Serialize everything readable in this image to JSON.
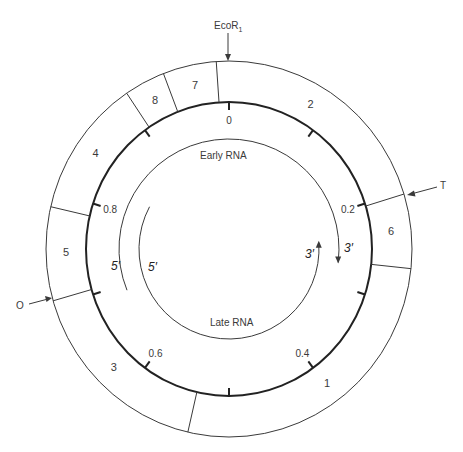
{
  "geometry": {
    "cx": 229,
    "cy": 249,
    "outer_rx": 183,
    "outer_ry": 188,
    "inner_rx": 143,
    "inner_ry": 147,
    "early_r": 110,
    "late_r": 90
  },
  "colors": {
    "line": "#3a3a3a",
    "thick_line": "#222222",
    "text": "#3a3a3a",
    "background": "#ffffff"
  },
  "segment_boundaries_deg": [
    -4,
    -21,
    -34,
    -77,
    -106,
    193,
    96,
    73
  ],
  "segments": [
    {
      "label": "7",
      "angle": -12,
      "r": 165
    },
    {
      "label": "8",
      "angle": -27,
      "r": 165
    },
    {
      "label": "4",
      "angle": -55,
      "r": 165
    },
    {
      "label": "5",
      "angle": -91,
      "r": 165
    },
    {
      "label": "3",
      "angle": -135,
      "r": 165
    },
    {
      "label": "1",
      "angle": 143,
      "r": 165
    },
    {
      "label": "6",
      "angle": 84,
      "r": 165
    },
    {
      "label": "2",
      "angle": 30,
      "r": 165
    }
  ],
  "ticks": [
    {
      "angle": 0,
      "label": "0"
    },
    {
      "angle": 36,
      "label": ""
    },
    {
      "angle": 72,
      "label": "0.2"
    },
    {
      "angle": 108,
      "label": ""
    },
    {
      "angle": 144,
      "label": "0.4"
    },
    {
      "angle": 180,
      "label": ""
    },
    {
      "angle": 216,
      "label": "0.6"
    },
    {
      "angle": 252,
      "label": ""
    },
    {
      "angle": 288,
      "label": "0.8"
    },
    {
      "angle": 324,
      "label": ""
    }
  ],
  "markers": {
    "ecori": {
      "label_main": "EcoR",
      "label_sub": "1"
    },
    "t": {
      "label": "T"
    },
    "o": {
      "label": "O"
    }
  },
  "transcripts": {
    "early": {
      "label": "Early RNA",
      "five_prime": "5′",
      "three_prime": "3′"
    },
    "late": {
      "label": "Late RNA",
      "five_prime": "5′",
      "three_prime": "3′"
    }
  }
}
